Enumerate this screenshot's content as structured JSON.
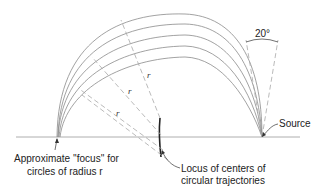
{
  "diagram": {
    "angle_label": "20°",
    "radius_labels": [
      "r",
      "r",
      "r",
      "r"
    ],
    "source_label": "Source",
    "focus_label_line1": "Approximate ''focus'' for",
    "focus_label_line2": "circles of radius r",
    "locus_label_line1": "Locus of centers of",
    "locus_label_line2": "circular trajectories",
    "trajectory_count": 5,
    "colors": {
      "arcs": "#8a8a8a",
      "ground": "#9a9a9a",
      "dashed": "#a8a8a8",
      "text": "#222222"
    }
  }
}
